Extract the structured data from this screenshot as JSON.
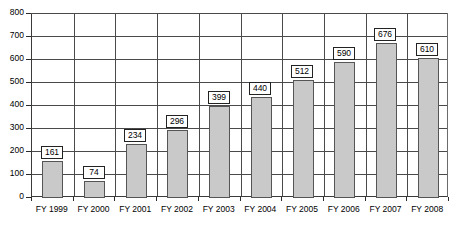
{
  "chart_data": {
    "type": "bar",
    "title": "",
    "subtitle": "",
    "xlabel": "",
    "ylabel": "",
    "categories": [
      "FY 1999",
      "FY 2000",
      "FY 2001",
      "FY 2002",
      "FY 2003",
      "FY 2004",
      "FY 2005",
      "FY 2006",
      "FY 2007",
      "FY 2008"
    ],
    "values": [
      161,
      74,
      234,
      296,
      399,
      440,
      512,
      590,
      676,
      610
    ],
    "data_labels": [
      "161",
      "74",
      "234",
      "296",
      "399",
      "440",
      "512",
      "590",
      "676",
      "610"
    ],
    "ylim": [
      0,
      800
    ],
    "ytick_labels": [
      "800",
      "700",
      "600",
      "500",
      "400",
      "300",
      "200",
      "100",
      "0"
    ],
    "ytick_values": [
      800,
      700,
      600,
      500,
      400,
      300,
      200,
      100,
      0
    ],
    "grid": true,
    "legend": "none",
    "legend_position": "none",
    "colors": {
      "bar_fill": "#c9c9c9",
      "bar_border": "#555555",
      "gridline": "#4a4a4a",
      "frame": "#3a3a3a",
      "label_box_fill": "#ffffff",
      "label_box_border": "#222222",
      "text": "#000000",
      "background": "#ffffff"
    }
  }
}
